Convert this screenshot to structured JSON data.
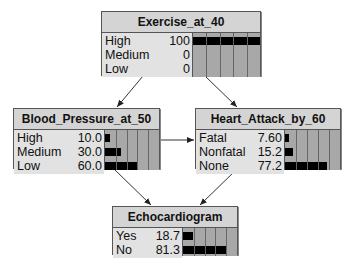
{
  "nodes": {
    "exercise": {
      "title": "Exercise_at_40",
      "states": [
        {
          "label": "High",
          "value": "100",
          "pct": 100
        },
        {
          "label": "Medium",
          "value": "0",
          "pct": 0
        },
        {
          "label": "Low",
          "value": "0",
          "pct": 0
        }
      ]
    },
    "blood_pressure": {
      "title": "Blood_Pressure_at_50",
      "states": [
        {
          "label": "High",
          "value": "10.0",
          "pct": 10.0
        },
        {
          "label": "Medium",
          "value": "30.0",
          "pct": 30.0
        },
        {
          "label": "Low",
          "value": "60.0",
          "pct": 60.0
        }
      ]
    },
    "heart_attack": {
      "title": "Heart_Attack_by_60",
      "states": [
        {
          "label": "Fatal",
          "value": "7.60",
          "pct": 7.6
        },
        {
          "label": "Nonfatal",
          "value": "15.2",
          "pct": 15.2
        },
        {
          "label": "None",
          "value": "77.2",
          "pct": 77.2
        }
      ]
    },
    "echo": {
      "title": "Echocardiogram",
      "states": [
        {
          "label": "Yes",
          "value": "18.7",
          "pct": 18.7
        },
        {
          "label": "No",
          "value": "81.3",
          "pct": 81.3
        }
      ]
    }
  },
  "edges": [
    {
      "from": "Exercise_at_40",
      "to": "Blood_Pressure_at_50"
    },
    {
      "from": "Exercise_at_40",
      "to": "Heart_Attack_by_60"
    },
    {
      "from": "Blood_Pressure_at_50",
      "to": "Heart_Attack_by_60"
    },
    {
      "from": "Blood_Pressure_at_50",
      "to": "Echocardiogram"
    },
    {
      "from": "Heart_Attack_by_60",
      "to": "Echocardiogram"
    }
  ]
}
